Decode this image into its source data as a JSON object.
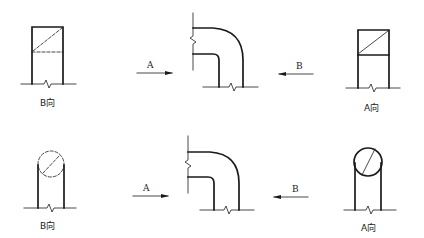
{
  "diagram": {
    "rows": [
      {
        "name": "square-duct-elbow",
        "left_view": {
          "caption": "B向",
          "shape": "rectangle-with-dashed-diagonal"
        },
        "elbow": {
          "arrow_a_label": "A",
          "arrow_b_label": "B"
        },
        "right_view": {
          "caption": "A向",
          "shape": "rectangle-with-solid-diagonal"
        }
      },
      {
        "name": "round-pipe-elbow",
        "left_view": {
          "caption": "B向",
          "shape": "dashed-circle-with-diagonal"
        },
        "elbow": {
          "arrow_a_label": "A",
          "arrow_b_label": "B"
        },
        "right_view": {
          "caption": "A向",
          "shape": "solid-circle-with-diagonal"
        }
      }
    ],
    "colors": {
      "line": "#1a1a1a",
      "background": "#ffffff"
    }
  }
}
